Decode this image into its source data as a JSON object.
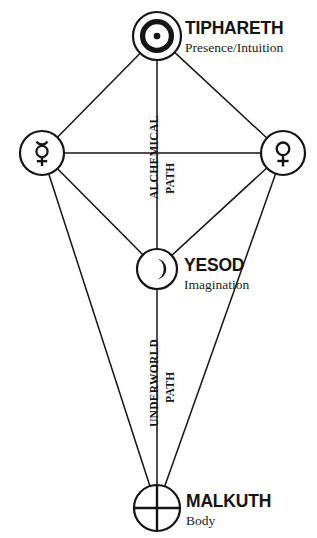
{
  "diagram": {
    "type": "tree-of-life-sephiroth",
    "background_color": "#ffffff",
    "line_color": "#151515",
    "width": 317,
    "height": 538,
    "nodes": [
      {
        "id": "tiphareth",
        "symbol_name": "sun-symbol",
        "symbol_char": "☉",
        "title": "TIPHARETH",
        "subtitle": "Presence/Intuition",
        "cx": 157,
        "cy": 36,
        "r": 24,
        "label_x": 185,
        "label_y": 18
      },
      {
        "id": "mercury",
        "symbol_name": "mercury-symbol",
        "symbol_char": "☿",
        "title": "",
        "subtitle": "",
        "cx": 42,
        "cy": 153,
        "r": 22,
        "label_x": 0,
        "label_y": 0
      },
      {
        "id": "venus",
        "symbol_name": "venus-symbol",
        "symbol_char": "♀",
        "title": "",
        "subtitle": "",
        "cx": 283,
        "cy": 153,
        "r": 22,
        "label_x": 0,
        "label_y": 0
      },
      {
        "id": "yesod",
        "symbol_name": "crescent-moon-symbol",
        "symbol_char": "☽",
        "title": "YESOD",
        "subtitle": "Imagination",
        "cx": 157,
        "cy": 269,
        "r": 20,
        "label_x": 184,
        "label_y": 255
      },
      {
        "id": "malkuth",
        "symbol_name": "earth-symbol",
        "symbol_char": "⊕",
        "title": "MALKUTH",
        "subtitle": "Body",
        "cx": 157,
        "cy": 508,
        "r": 23,
        "label_x": 186,
        "label_y": 491
      }
    ],
    "edges": [
      {
        "from": "tiphareth",
        "to": "mercury"
      },
      {
        "from": "tiphareth",
        "to": "venus"
      },
      {
        "from": "tiphareth",
        "to": "yesod"
      },
      {
        "from": "mercury",
        "to": "venus"
      },
      {
        "from": "mercury",
        "to": "yesod"
      },
      {
        "from": "venus",
        "to": "yesod"
      },
      {
        "from": "mercury",
        "to": "malkuth"
      },
      {
        "from": "venus",
        "to": "malkuth"
      },
      {
        "from": "yesod",
        "to": "malkuth"
      }
    ],
    "path_labels": [
      {
        "id": "alchemical-path",
        "word_primary": "ALCHEMICAL",
        "word_secondary": "PATH",
        "primary_x": 148,
        "primary_y": 199,
        "secondary_x": 164,
        "secondary_y": 194
      },
      {
        "id": "underworld-path",
        "word_primary": "UNDERWORLD",
        "word_secondary": "PATH",
        "primary_x": 148,
        "primary_y": 427,
        "secondary_x": 164,
        "secondary_y": 403
      }
    ]
  }
}
